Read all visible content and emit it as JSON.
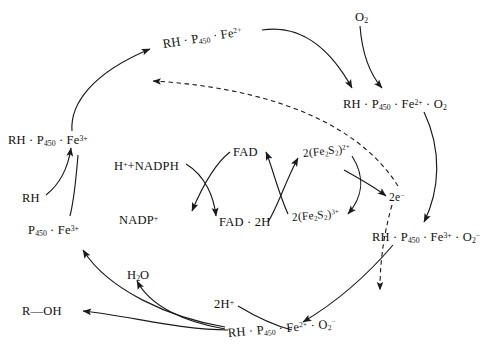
{
  "diagram": {
    "type": "cycle-diagram",
    "stroke_color": "#1a1a1a",
    "background_color": "#ffffff",
    "nodes": [
      {
        "id": "rh_p450_fe2",
        "text_html": "RH · P<sub>450</sub> · Fe<sup>2+</sup>",
        "plain": "RH · P450 · Fe2+",
        "x": 163,
        "y": 38,
        "rot": -9
      },
      {
        "id": "o2",
        "text_html": "O<sub>2</sub>",
        "plain": "O2",
        "x": 355,
        "y": 11,
        "rot": 0
      },
      {
        "id": "rh_p450_fe2_o2",
        "text_html": "RH · P<sub>450</sub> · Fe<sup>2+</sup> · O<sub>2</sub>",
        "plain": "RH · P450 · Fe2+ · O2",
        "x": 343,
        "y": 98,
        "rot": 0
      },
      {
        "id": "rh_p450_fe3",
        "text_html": "RH · P<sub>450</sub> · Fe<sup>3+</sup>",
        "plain": "RH · P450 · Fe3+",
        "x": 8,
        "y": 134,
        "rot": 0
      },
      {
        "id": "rh",
        "text_html": "RH",
        "plain": "RH",
        "x": 22,
        "y": 192,
        "rot": 0
      },
      {
        "id": "p450_fe3",
        "text_html": "P<sub>450</sub> · Fe<sup>3+</sup>",
        "plain": "P450 · Fe3+",
        "x": 28,
        "y": 224,
        "rot": 0
      },
      {
        "id": "h_nadph",
        "text_html": "H<sup>+</sup>+NADPH",
        "plain": "H+ + NADPH",
        "x": 114,
        "y": 160,
        "rot": 0
      },
      {
        "id": "nadp_plus",
        "text_html": "NADP<sup>+</sup>",
        "plain": "NADP+",
        "x": 119,
        "y": 214,
        "rot": 0
      },
      {
        "id": "fad",
        "text_html": "FAD",
        "plain": "FAD",
        "x": 233,
        "y": 146,
        "rot": 0
      },
      {
        "id": "fad_2h",
        "text_html": "FAD · 2H",
        "plain": "FAD · 2H",
        "x": 219,
        "y": 216,
        "rot": 0
      },
      {
        "id": "fe2s2_2plus",
        "text_html": "2(Fe<sub>2</sub>S<sub>2</sub>)<sup>2+</sup>",
        "plain": "2(Fe2S2)2+",
        "x": 303,
        "y": 148,
        "rot": -6
      },
      {
        "id": "fe2s2_3plus",
        "text_html": "2(Fe<sub>2</sub>S<sub>2</sub>)<sup>3+</sup>",
        "plain": "2(Fe2S2)3+",
        "x": 292,
        "y": 212,
        "rot": -4
      },
      {
        "id": "two_electrons",
        "text_html": "2e<sup>−</sup>",
        "plain": "2e-",
        "x": 389,
        "y": 192,
        "rot": 0
      },
      {
        "id": "rh_p450_fe3_o2rad",
        "text_html": "RH · P<sub>450</sub> · Fe<sup>3+</sup> · O<sub>2</sub><sup>−</sup>",
        "plain": "RH · P450 · Fe3+ · O2-",
        "x": 372,
        "y": 231,
        "rot": 0
      },
      {
        "id": "rh_p450_fe2_o2rad",
        "text_html": "RH · P<sub>450</sub> · Fe<sup>2+</sup> · O<sub>2</sub><sup>−</sup>",
        "plain": "RH · P450 · Fe2+ · O2-",
        "x": 228,
        "y": 327,
        "rot": -5
      },
      {
        "id": "two_h_plus",
        "text_html": "2H<sup>+</sup>",
        "plain": "2H+",
        "x": 214,
        "y": 298,
        "rot": 0
      },
      {
        "id": "water",
        "text_html": "H<sub>2</sub>O",
        "plain": "H2O",
        "x": 127,
        "y": 269,
        "rot": 0
      },
      {
        "id": "r_oh",
        "text_html": "R—OH",
        "plain": "R—OH",
        "x": 22,
        "y": 305,
        "rot": 0
      }
    ],
    "edges": [
      {
        "id": "e-rh-binds",
        "from": "rh_p450_fe3",
        "to": "rh_p450_fe2",
        "style": "solid",
        "label": ""
      },
      {
        "id": "e-o2-binds",
        "from": "rh_p450_fe2",
        "to": "rh_p450_fe2_o2",
        "style": "solid",
        "label": ""
      },
      {
        "id": "e-o2-enters",
        "from": "o2",
        "to": "rh_p450_fe2_o2",
        "style": "solid",
        "label": ""
      },
      {
        "id": "e-first-reduction",
        "from": "two_electrons",
        "to": "rh_p450_fe2",
        "style": "dashed",
        "label": ""
      },
      {
        "id": "e-superoxide",
        "from": "rh_p450_fe2_o2",
        "to": "rh_p450_fe3_o2rad",
        "style": "solid",
        "label": ""
      },
      {
        "id": "e-second-reduction",
        "from": "two_electrons",
        "to": "rh_p450_fe2_o2rad",
        "style": "dashed",
        "label": ""
      },
      {
        "id": "e-peroxo",
        "from": "rh_p450_fe3_o2rad",
        "to": "rh_p450_fe2_o2rad",
        "style": "solid",
        "label": ""
      },
      {
        "id": "e-protonation",
        "from": "two_h_plus",
        "to": "rh_p450_fe2_o2rad",
        "style": "solid",
        "label": ""
      },
      {
        "id": "e-water-release",
        "from": "rh_p450_fe2_o2rad",
        "to": "water",
        "style": "solid",
        "label": ""
      },
      {
        "id": "e-product-release",
        "from": "rh_p450_fe2_o2rad",
        "to": "r_oh",
        "style": "solid",
        "label": ""
      },
      {
        "id": "e-regenerate-enzyme",
        "from": "rh_p450_fe2_o2rad",
        "to": "p450_fe3",
        "style": "solid",
        "label": ""
      },
      {
        "id": "e-substrate-binding",
        "from": "rh",
        "to": "rh_p450_fe3",
        "style": "solid",
        "label": ""
      },
      {
        "id": "e-nadph-to-fad2h",
        "from": "h_nadph",
        "to": "fad_2h",
        "style": "solid",
        "label": ""
      },
      {
        "id": "e-fad-to-nadp",
        "from": "fad",
        "to": "nadp_plus",
        "style": "solid",
        "label": ""
      },
      {
        "id": "e-fad2h-to-fe2s2-2",
        "from": "fad_2h",
        "to": "fe2s2_2plus",
        "style": "solid",
        "label": ""
      },
      {
        "id": "e-fe2s2-3-to-fad",
        "from": "fe2s2_3plus",
        "to": "fad",
        "style": "solid",
        "label": ""
      },
      {
        "id": "e-fe2s2-2-to-2e",
        "from": "fe2s2_2plus",
        "to": "fe2s2_3plus",
        "style": "solid",
        "label": ""
      },
      {
        "id": "e-cluster-to-electrons",
        "from": "fe2s2_3plus",
        "to": "two_electrons",
        "style": "solid",
        "label": ""
      }
    ]
  }
}
